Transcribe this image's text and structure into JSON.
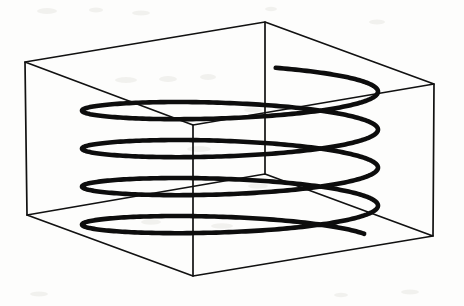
{
  "figure": {
    "background_color": "#fdfdfc",
    "line_color": "#111111",
    "helix_color": "#0d0d0d",
    "width": 464,
    "height": 306
  },
  "box": {
    "name": "rectangular-box-wireframe",
    "stroke_width": 1.7,
    "vertices": {
      "top_left": [
        25,
        62
      ],
      "top_back": [
        265,
        22
      ],
      "top_right": [
        434,
        84
      ],
      "top_front": [
        193,
        125
      ],
      "bottom_left": [
        27,
        215
      ],
      "bottom_back": [
        265,
        174
      ],
      "bottom_right": [
        433,
        236
      ],
      "bottom_front": [
        193,
        276
      ]
    },
    "top_face_path": "M 25 62 L 265 22 L 434 84 L 193 125 Z",
    "bottom_face_path": "M 27 215 L 265 174 L 433 236 L 193 276 Z",
    "vertical_edges": [
      "M 25 62 L 27 215",
      "M 265 22 L 265 174",
      "M 434 84 L 433 236",
      "M 193 125 L 193 276"
    ]
  },
  "helix": {
    "name": "helix-coil",
    "turns": 4,
    "stroke_width": 4.6,
    "center_x": 230,
    "radius_x": 148,
    "radius_y": 17,
    "top_y": 84,
    "pitch": 38,
    "start_angle_deg": 18,
    "end_angle_deg": 1505,
    "left_extent": 82,
    "right_extent": 378,
    "back_arc_peaks_y": [
      68,
      106,
      144,
      182
    ],
    "front_arc_valleys_y": [
      101,
      139,
      177,
      215
    ],
    "free_end_top": [
      376,
      72
    ],
    "free_end_bottom": [
      374,
      229
    ]
  },
  "chart_data": {
    "type": "line",
    "xlabel": "",
    "ylabel": "",
    "series": [
      {
        "name": "helix-curve",
        "parametric": true,
        "turns": 4,
        "radius": 148,
        "pitch": 38
      }
    ]
  }
}
